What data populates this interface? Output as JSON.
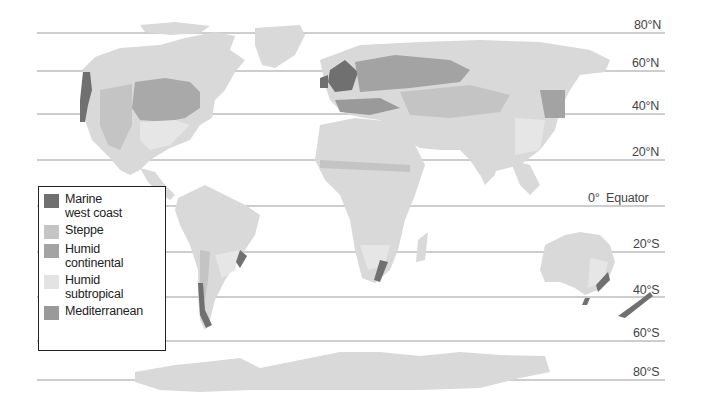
{
  "map": {
    "title": "Mid-latitude climate regions",
    "latitudes": [
      {
        "label": "80°N",
        "y": 33
      },
      {
        "label": "60°N",
        "y": 71
      },
      {
        "label": "40°N",
        "y": 114
      },
      {
        "label": "20°N",
        "y": 160
      },
      {
        "label": "0°  Equator",
        "y": 206
      },
      {
        "label": "20°S",
        "y": 252
      },
      {
        "label": "40°S",
        "y": 297
      },
      {
        "label": "60°S",
        "y": 341
      },
      {
        "label": "80°S",
        "y": 380
      }
    ],
    "colors": {
      "land": "#d9d9d9",
      "marine_west_coast": "#707070",
      "steppe": "#c2c2c2",
      "humid_continental": "#a3a3a3",
      "humid_subtropical": "#e6e6e6",
      "mediterranean": "#9a9a9a",
      "lat_line": "#9a9a9a"
    }
  },
  "legend": {
    "items": [
      {
        "label": "Marine west coast",
        "line1": "Marine",
        "line2": "west coast",
        "color": "#707070"
      },
      {
        "label": "Steppe",
        "line1": "Steppe",
        "line2": "",
        "color": "#c4c4c4"
      },
      {
        "label": "Humid continental",
        "line1": "Humid",
        "line2": "continental",
        "color": "#a3a3a3"
      },
      {
        "label": "Humid subtropical",
        "line1": "Humid",
        "line2": "subtropical",
        "color": "#e3e3e3"
      },
      {
        "label": "Mediterranean",
        "line1": "Mediterranean",
        "line2": "",
        "color": "#9a9a9a"
      }
    ]
  }
}
